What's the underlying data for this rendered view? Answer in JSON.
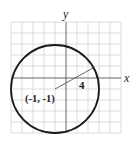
{
  "diagram": {
    "type": "circle-on-coordinate-grid",
    "x_axis_label": "x",
    "y_axis_label": "y",
    "center_label": "(-1, -1)",
    "radius_label": "4",
    "center": [
      -1,
      -1
    ],
    "radius": 4,
    "grid_range": {
      "x": [
        -5,
        5
      ],
      "y": [
        -5,
        5
      ]
    },
    "colors": {
      "grid": "#c8c8c8",
      "axes": "#555555",
      "circle": "#1a1a1a",
      "radius_line": "#444444"
    }
  }
}
